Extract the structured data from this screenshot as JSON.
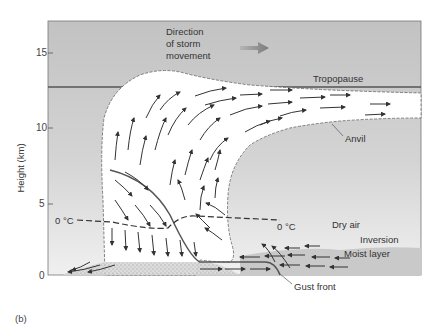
{
  "figure": {
    "panel_label": "(b)",
    "y_axis": {
      "label": "Height (km)",
      "ticks": [
        "0",
        "5",
        "10",
        "15"
      ]
    },
    "annotations": {
      "direction_line1": "Direction",
      "direction_line2": "of storm",
      "direction_line3": "movement",
      "tropopause": "Tropopause",
      "anvil": "Anvil",
      "freezing_left": "0 °C",
      "freezing_right": "0 °C",
      "dry_air": "Dry air",
      "inversion": "Inversion",
      "moist_layer": "Moist layer",
      "gust_front": "Gust front"
    },
    "colors": {
      "background_top": "#c4c4c4",
      "background_bottom": "#ebebeb",
      "cloud": "#ffffff",
      "moist_layer": "#c8c8c8",
      "arrow": "#3a3a3a",
      "storm_arrow": "#8a8a8a",
      "line": "#555555"
    }
  }
}
